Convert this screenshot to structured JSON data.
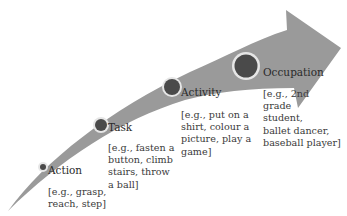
{
  "diagram": {
    "type": "progression-arrow",
    "arrow_color": "#9a9a9a",
    "node_fill": "#4a4a4a",
    "node_ring": "#e6e6e6",
    "stages": [
      {
        "label": "Action",
        "example": "[e.g., grasp,\nreach, step]"
      },
      {
        "label": "Task",
        "example": "[e.g., fasten a\nbutton, climb\nstairs, throw\na ball]"
      },
      {
        "label": "Activity",
        "example": "[e.g., put on a\nshirt, colour a\npicture, play a\ngame]"
      },
      {
        "label": "Occupation",
        "example": "[e.g., 2nd\ngrade\nstudent,\nballet dancer,\nbaseball player]"
      }
    ]
  }
}
